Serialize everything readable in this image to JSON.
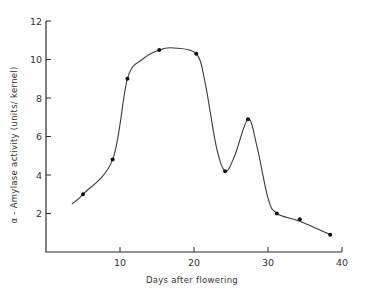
{
  "chart_data": {
    "type": "line",
    "title": "",
    "xlabel": "Days after flowering",
    "ylabel": "α - Amylase activity (units/ kernel)",
    "xlim": [
      0,
      40
    ],
    "ylim": [
      0,
      12
    ],
    "xticks": [
      10,
      20,
      30,
      40
    ],
    "yticks": [
      2,
      4,
      6,
      8,
      10,
      12
    ],
    "grid": false,
    "legend": null,
    "series": [
      {
        "name": "α-Amylase activity",
        "x": [
          5,
          9,
          11,
          15.3,
          20.3,
          24.2,
          27.3,
          31.2,
          34.3,
          38.4
        ],
        "y": [
          3.0,
          4.8,
          9.0,
          10.5,
          10.3,
          4.2,
          6.9,
          2.0,
          1.7,
          0.9
        ],
        "marker": "dot"
      }
    ],
    "smooth_curve": {
      "x": [
        3.5,
        5,
        9,
        11,
        13,
        15.3,
        17.3,
        20.3,
        21.5,
        23,
        24.2,
        25.5,
        27.3,
        28.5,
        30,
        31.2,
        34.3,
        38.4
      ],
      "y": [
        2.5,
        3.0,
        4.8,
        9.0,
        10.0,
        10.5,
        10.6,
        10.3,
        8.8,
        5.5,
        4.2,
        5.0,
        6.9,
        5.5,
        2.8,
        2.0,
        1.6,
        0.9
      ]
    }
  },
  "labels": {
    "xlabel": "Days after flowering",
    "ylabel": "α - Amylase activity (units/ kernel)"
  }
}
